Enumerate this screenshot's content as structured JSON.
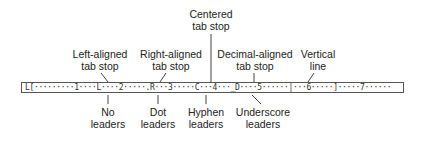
{
  "ruler": {
    "text": "L[·········1····L····2·····.R···3·····C···4···_D····5······|···6·····]·····7······"
  },
  "top_labels": [
    {
      "id": "left-aligned",
      "line1": "Left-aligned",
      "line2": "tab stop"
    },
    {
      "id": "right-aligned",
      "line1": "Right-aligned",
      "line2": "tab stop"
    },
    {
      "id": "centered",
      "line1": "Centered",
      "line2": "tab stop"
    },
    {
      "id": "decimal-aligned",
      "line1": "Decimal-aligned",
      "line2": "tab stop"
    },
    {
      "id": "vertical-line",
      "line1": "Vertical",
      "line2": "line"
    }
  ],
  "bottom_labels": [
    {
      "id": "no-leaders",
      "line1": "No",
      "line2": "leaders"
    },
    {
      "id": "dot-leaders",
      "line1": "Dot",
      "line2": "leaders"
    },
    {
      "id": "hyphen-leaders",
      "line1": "Hyphen",
      "line2": "leaders"
    },
    {
      "id": "underscore-leaders",
      "line1": "Underscore",
      "line2": "leaders"
    }
  ],
  "colors": {
    "line": "#444444",
    "text": "#222222",
    "ruler_border": "#555555"
  }
}
